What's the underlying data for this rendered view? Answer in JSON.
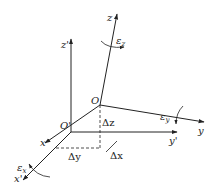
{
  "diagram": {
    "type": "coordinate-frame-displacement",
    "colors": {
      "stroke": "#222222",
      "background": "#ffffff"
    },
    "origins": [
      {
        "id": "O",
        "label": "O",
        "x": 100,
        "y": 105
      },
      {
        "id": "O_prime",
        "label": "O'",
        "x": 71,
        "y": 132
      }
    ],
    "axes": [
      {
        "id": "z",
        "label": "z",
        "from": "O",
        "to": [
          117,
          13
        ]
      },
      {
        "id": "y",
        "label": "y",
        "from": "O",
        "to": [
          205,
          122
        ]
      },
      {
        "id": "x",
        "label": "x",
        "from": "O",
        "to": [
          44,
          144
        ]
      },
      {
        "id": "z_prime",
        "label": "z'",
        "from": "O_prime",
        "to": [
          71,
          38
        ]
      },
      {
        "id": "y_prime",
        "label": "y'",
        "from": "O_prime",
        "to": [
          178,
          132
        ]
      },
      {
        "id": "x_prime",
        "label": "x'",
        "from": "O_prime",
        "to": [
          22,
          181
        ]
      }
    ],
    "displacements": [
      {
        "id": "dz",
        "label": "Δz"
      },
      {
        "id": "dx",
        "label": "Δx"
      },
      {
        "id": "dy",
        "label": "Δy"
      }
    ],
    "rotations": [
      {
        "id": "eps_z",
        "symbol": "ε",
        "subscript": "z"
      },
      {
        "id": "eps_y",
        "symbol": "ε",
        "subscript": "y"
      },
      {
        "id": "eps_x",
        "symbol": "ε",
        "subscript": "x"
      }
    ]
  },
  "labels": {
    "z": "z",
    "y": "y",
    "x": "x",
    "z_prime": "z'",
    "y_prime": "y'",
    "x_prime": "x'",
    "O": "O",
    "O_prime": "O'",
    "dz": "Δz",
    "dx": "Δx",
    "dy": "Δy",
    "eps": "ε",
    "eps_z_sub": "z",
    "eps_y_sub": "y",
    "eps_x_sub": "x"
  }
}
